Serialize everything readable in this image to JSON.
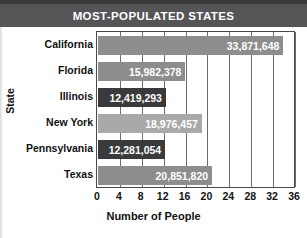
{
  "chart_data": {
    "type": "bar",
    "orientation": "horizontal",
    "title": "MOST-POPULATED STATES",
    "xlabel": "Number of People",
    "ylabel": "State",
    "categories": [
      "California",
      "Florida",
      "Illinois",
      "New York",
      "Pennsylvania",
      "Texas"
    ],
    "values": [
      33871648,
      15982378,
      12419293,
      18976457,
      12281054,
      20851820
    ],
    "value_labels": [
      "33,871,648",
      "15,982,378",
      "12,419,293",
      "18,976,457",
      "12,281,054",
      "20,851,820"
    ],
    "value_scale": "millions",
    "values_millions": [
      33.871648,
      15.982378,
      12.419293,
      18.976457,
      12.281054,
      20.85182
    ],
    "xlim": [
      0,
      36
    ],
    "xtick_labels": [
      "0",
      "4",
      "8",
      "12",
      "16",
      "20",
      "24",
      "28",
      "32",
      "36"
    ],
    "xtick_values": [
      0,
      4,
      8,
      12,
      16,
      20,
      24,
      28,
      32,
      36
    ],
    "grid": true,
    "legend": false,
    "bar_colors": [
      "#8d8d8d",
      "#8d8d8d",
      "#3a3a3c",
      "#a9a9a9",
      "#3a3a3c",
      "#8d8d8d"
    ],
    "value_text_color": "#ffffff",
    "title_background": "#555558",
    "title_text_color": "#ffffff",
    "axis_color": "#4a4a4a",
    "gridline_color": "#6d6d6d",
    "background": "#ffffff"
  }
}
